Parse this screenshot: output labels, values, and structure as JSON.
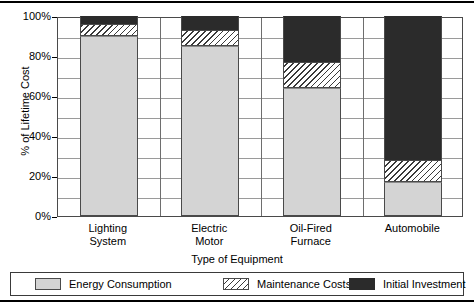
{
  "chart_data": {
    "type": "bar",
    "subtype": "stacked-100-percent",
    "title": "",
    "xlabel": "Type of Equipment",
    "ylabel": "% of Lifetime Cost",
    "ylim": [
      0,
      100
    ],
    "ytick_labels": [
      "0%",
      "20%",
      "40%",
      "60%",
      "80%",
      "100%"
    ],
    "ytick_values": [
      0,
      20,
      40,
      60,
      80,
      100
    ],
    "gridlines_every": 10,
    "grid": true,
    "legend_position": "bottom",
    "categories": [
      "Lighting System",
      "Electric Motor",
      "Oil-Fired Furnace",
      "Automobile"
    ],
    "category_lines": [
      [
        "Lighting",
        "System"
      ],
      [
        "Electric",
        "Motor"
      ],
      [
        "Oil-Fired",
        "Furnace"
      ],
      [
        "Automobile"
      ]
    ],
    "series": [
      {
        "name": "Energy Consumption",
        "color": "#d4d4d4",
        "pattern": "solid-light-gray",
        "values": [
          90,
          85,
          64,
          17
        ]
      },
      {
        "name": "Maintenance Costs",
        "color": "#ffffff",
        "pattern": "diagonal-hatch",
        "values": [
          6,
          8,
          13,
          11
        ]
      },
      {
        "name": "Initial Investment",
        "color": "#2b2b2b",
        "pattern": "solid-dark",
        "values": [
          4,
          7,
          23,
          72
        ]
      }
    ]
  }
}
